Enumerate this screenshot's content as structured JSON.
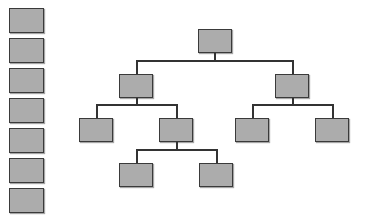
{
  "legend_column": {
    "box_count": 7,
    "boxes": [
      {
        "id": "legend-1",
        "top": 8
      },
      {
        "id": "legend-2",
        "top": 38
      },
      {
        "id": "legend-3",
        "top": 68
      },
      {
        "id": "legend-4",
        "top": 98
      },
      {
        "id": "legend-5",
        "top": 128
      },
      {
        "id": "legend-6",
        "top": 158
      },
      {
        "id": "legend-7",
        "top": 188
      }
    ]
  },
  "tree": {
    "node_fill": "#acacac",
    "line_color": "#333333",
    "levels": 4,
    "nodes": [
      {
        "id": "root",
        "level": 0
      },
      {
        "id": "l1-left",
        "level": 1,
        "parent": "root"
      },
      {
        "id": "l1-right",
        "level": 1,
        "parent": "root"
      },
      {
        "id": "l2-a",
        "level": 2,
        "parent": "l1-left"
      },
      {
        "id": "l2-b",
        "level": 2,
        "parent": "l1-left"
      },
      {
        "id": "l2-c",
        "level": 2,
        "parent": "l1-right"
      },
      {
        "id": "l2-d",
        "level": 2,
        "parent": "l1-right"
      },
      {
        "id": "l3-a",
        "level": 3,
        "parent": "l2-b"
      },
      {
        "id": "l3-b",
        "level": 3,
        "parent": "l2-b"
      }
    ]
  }
}
